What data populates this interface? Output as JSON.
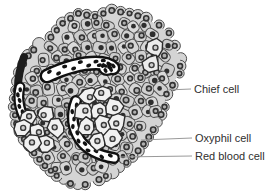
{
  "figure": {
    "background": "#ffffff",
    "labels": [
      {
        "id": "chief-cell",
        "text": "Chief cell",
        "line": {
          "x1": 167,
          "y1": 90,
          "x2": 191,
          "y2": 89
        },
        "text_x": 194,
        "text_y": 83
      },
      {
        "id": "oxyphil-cell",
        "text": "Oxyphil cell",
        "line": {
          "x1": 141,
          "y1": 140,
          "x2": 192,
          "y2": 138
        },
        "text_x": 195,
        "text_y": 132
      },
      {
        "id": "red-blood-cell",
        "text": "Red blood cell",
        "line": {
          "x1": 119,
          "y1": 157,
          "x2": 192,
          "y2": 156
        },
        "text_x": 195,
        "text_y": 150
      }
    ],
    "colors": {
      "chief_cell_fill": "#d4d4d4",
      "chief_cell_stroke": "#4d4d4d",
      "nucleus_ring": "#333333",
      "nucleus_center": "#b0b0b0",
      "nucleus_solid": "#2e2e2e",
      "oxyphil_fill": "#f1f1f1",
      "oxyphil_pale_fill": "#ececec",
      "oxyphil_stroke": "#2c2c2c",
      "capillary_fill": "#ffffff",
      "capillary_stroke": "#111111",
      "rbc_fill": "#121212",
      "dark_vessel": "#1d1d1d",
      "label_text": "#2f2f2f",
      "leader_line": "#9a9a9a"
    }
  }
}
